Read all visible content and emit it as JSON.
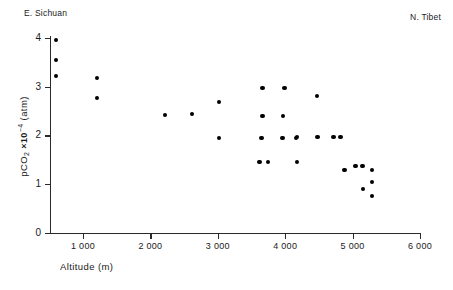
{
  "annotations": {
    "left_label": "E. Sichuan",
    "right_label": "N. Tibet"
  },
  "chart_data": {
    "type": "scatter",
    "title": "",
    "xlabel": "Altitude (m)",
    "ylabel": "pCO2 x10-4 (atm)",
    "ylabel_parts": {
      "p": "p",
      "co": "CO",
      "two": "2",
      "times": "×10",
      "exponent": "−4",
      "units": "(atm)"
    },
    "xlim": [
      510,
      6000
    ],
    "ylim": [
      0,
      4.1
    ],
    "xticks": [
      1000,
      2000,
      3000,
      4000,
      5000,
      6000
    ],
    "xticklabels": [
      "1 000",
      "2 000",
      "3 000",
      "4 000",
      "5 000",
      "6 000"
    ],
    "yticks": [
      0,
      1,
      2,
      3,
      4
    ],
    "yticklabels": [
      "0",
      "1",
      "2",
      "3",
      "4"
    ],
    "grid": false,
    "legend": false,
    "marker": "filled-circle",
    "marker_color": "#000000",
    "points": [
      {
        "x": 600,
        "y": 3.96
      },
      {
        "x": 600,
        "y": 3.55
      },
      {
        "x": 600,
        "y": 3.22
      },
      {
        "x": 1210,
        "y": 3.18
      },
      {
        "x": 1210,
        "y": 2.77
      },
      {
        "x": 2220,
        "y": 2.42
      },
      {
        "x": 2620,
        "y": 2.44
      },
      {
        "x": 3020,
        "y": 2.68
      },
      {
        "x": 3020,
        "y": 1.95
      },
      {
        "x": 3660,
        "y": 2.97
      },
      {
        "x": 3990,
        "y": 2.97
      },
      {
        "x": 3660,
        "y": 2.4
      },
      {
        "x": 3970,
        "y": 2.4
      },
      {
        "x": 3650,
        "y": 1.95
      },
      {
        "x": 3960,
        "y": 1.95
      },
      {
        "x": 4155,
        "y": 1.95
      },
      {
        "x": 4470,
        "y": 2.81
      },
      {
        "x": 4170,
        "y": 1.97
      },
      {
        "x": 4480,
        "y": 1.97
      },
      {
        "x": 4715,
        "y": 1.97
      },
      {
        "x": 4820,
        "y": 1.97
      },
      {
        "x": 3620,
        "y": 1.46
      },
      {
        "x": 3740,
        "y": 1.46
      },
      {
        "x": 4170,
        "y": 1.46
      },
      {
        "x": 4880,
        "y": 1.29
      },
      {
        "x": 5045,
        "y": 1.37
      },
      {
        "x": 5145,
        "y": 1.37
      },
      {
        "x": 5290,
        "y": 1.29
      },
      {
        "x": 5290,
        "y": 1.05
      },
      {
        "x": 5155,
        "y": 0.9
      },
      {
        "x": 5290,
        "y": 0.76
      }
    ]
  }
}
